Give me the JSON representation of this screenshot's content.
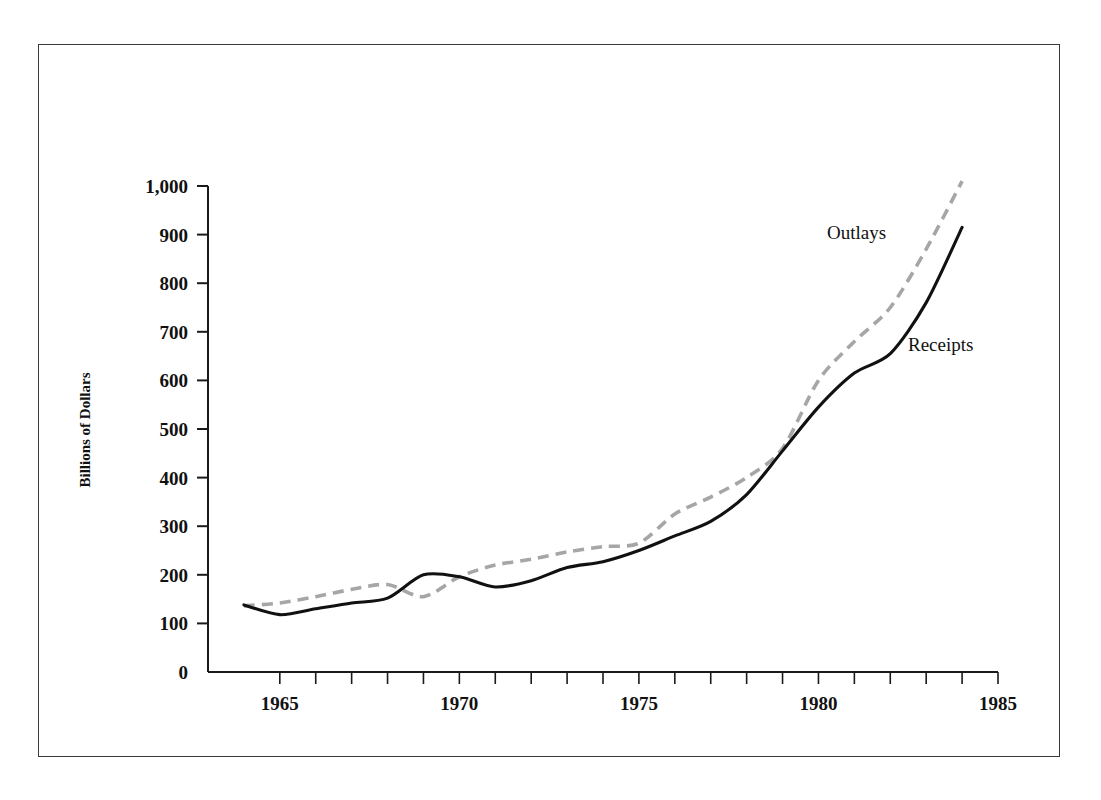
{
  "figure": {
    "title": "Federal Income and Expenses",
    "title_color": "#8c8c8c",
    "frame_color": "#3a3a3a",
    "background": "#ffffff"
  },
  "axes": {
    "ylabel": "Billions of Dollars",
    "xlabel": "",
    "y_ticks": [
      "0",
      "100",
      "200",
      "300",
      "400",
      "500",
      "600",
      "700",
      "800",
      "900",
      "1,000"
    ],
    "x_ticks_labeled": [
      "1965",
      "1970",
      "1975",
      "1980",
      "1985"
    ]
  },
  "series_labels": {
    "outlays": "Outlays",
    "receipts": "Receipts"
  },
  "chart_data": {
    "type": "line",
    "title": "Federal Income and Expenses",
    "xlabel": "",
    "ylabel": "Billions of Dollars",
    "xlim": [
      1964,
      1985
    ],
    "ylim": [
      0,
      1000
    ],
    "grid": false,
    "legend": "inline annotations near line ends",
    "y_tick_values": [
      0,
      100,
      200,
      300,
      400,
      500,
      600,
      700,
      800,
      900,
      1000
    ],
    "y_tick_labels": [
      "0",
      "100",
      "200",
      "300",
      "400",
      "500",
      "600",
      "700",
      "800",
      "900",
      "1,000"
    ],
    "x_tick_values": [
      1965,
      1966,
      1967,
      1968,
      1969,
      1970,
      1971,
      1972,
      1973,
      1974,
      1975,
      1976,
      1977,
      1978,
      1979,
      1980,
      1981,
      1982,
      1983,
      1984,
      1985
    ],
    "x_tick_labels_shown": [
      1965,
      1970,
      1975,
      1980,
      1985
    ],
    "x": [
      1964,
      1965,
      1966,
      1967,
      1968,
      1969,
      1970,
      1971,
      1972,
      1973,
      1974,
      1975,
      1976,
      1977,
      1978,
      1979,
      1980,
      1981,
      1982,
      1983,
      1984
    ],
    "series": [
      {
        "name": "Outlays",
        "style": "dashed",
        "color": "#a6a6a6",
        "values": [
          136,
          142,
          155,
          170,
          180,
          155,
          196,
          220,
          232,
          247,
          258,
          265,
          325,
          360,
          400,
          460,
          600,
          680,
          750,
          870,
          1010
        ]
      },
      {
        "name": "Receipts",
        "style": "solid",
        "color": "#111111",
        "values": [
          138,
          118,
          130,
          142,
          152,
          200,
          196,
          175,
          188,
          215,
          227,
          250,
          280,
          310,
          365,
          455,
          545,
          615,
          655,
          760,
          915
        ]
      }
    ]
  }
}
